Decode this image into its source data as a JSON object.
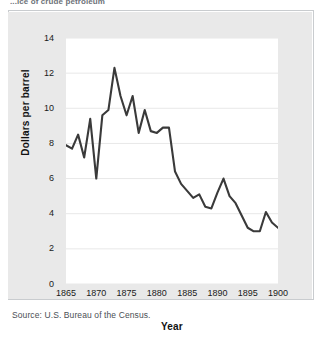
{
  "caption": {
    "clipped_title": "...ice of crude petroleum"
  },
  "source": {
    "text": "Source: U.S. Bureau of the Census."
  },
  "axes": {
    "y_title": "Dollars per barrel",
    "x_title": "Year",
    "y_ticks": [
      "0",
      "2",
      "4",
      "6",
      "8",
      "10",
      "12",
      "14"
    ],
    "x_ticks": [
      "1865",
      "1870",
      "1875",
      "1880",
      "1885",
      "1890",
      "1895",
      "1900"
    ]
  },
  "colors": {
    "line": "#3a3a3a",
    "panel": "#e9e9e9",
    "plot_bg": "#ffffff",
    "grid": "#e8e8e8",
    "text": "#1a1a1a",
    "rule": "#c9cccf"
  },
  "chart_data": {
    "type": "line",
    "title": "",
    "xlabel": "Year",
    "ylabel": "Dollars per barrel",
    "xlim": [
      1865,
      1900
    ],
    "ylim": [
      0,
      14
    ],
    "ytick_step": 2,
    "xtick_step": 5,
    "grid": true,
    "legend": "none",
    "x": [
      1865,
      1866,
      1867,
      1868,
      1869,
      1870,
      1871,
      1872,
      1873,
      1874,
      1875,
      1876,
      1877,
      1878,
      1879,
      1880,
      1881,
      1882,
      1883,
      1884,
      1885,
      1886,
      1887,
      1888,
      1889,
      1890,
      1891,
      1892,
      1893,
      1894,
      1895,
      1896,
      1897,
      1898,
      1899,
      1900
    ],
    "values": [
      7.9,
      7.7,
      8.5,
      7.2,
      9.4,
      6.0,
      9.6,
      9.9,
      12.3,
      10.7,
      9.6,
      10.7,
      8.6,
      9.9,
      8.7,
      8.6,
      8.9,
      8.9,
      6.4,
      5.7,
      5.3,
      4.9,
      5.1,
      4.4,
      4.3,
      5.2,
      6.0,
      5.0,
      4.6,
      3.9,
      3.2,
      3.0,
      3.0,
      4.1,
      3.5,
      3.2
    ]
  }
}
